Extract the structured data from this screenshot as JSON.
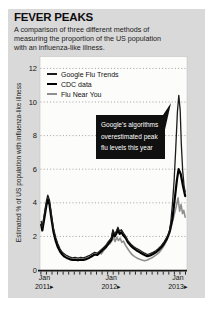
{
  "figure": {
    "title": "FEVER PEAKS",
    "subtitle_lines": [
      "A comparison of three different methods of",
      "measuring the proportion of the US population",
      "with an influenza-like illness."
    ]
  },
  "chart_data": {
    "type": "line",
    "title": "FEVER PEAKS",
    "ylabel": "Estimated % of US population with influenza-like illness",
    "ylim": [
      0,
      12
    ],
    "yticks": [
      0,
      2,
      4,
      6,
      8,
      10,
      12
    ],
    "x_encoding": "months since Jan 2011",
    "xlim": [
      -0.7,
      25.4
    ],
    "xticks": [
      {
        "m": 0,
        "month": "Jan",
        "year": "2011",
        "arrow": "▸"
      },
      {
        "m": 12,
        "month": "Jan",
        "year": "2012",
        "arrow": "▸"
      },
      {
        "m": 24,
        "month": "Jan",
        "year": "2013",
        "arrow": "▸"
      }
    ],
    "grid": "dotted-horizontal",
    "legend_position": "top-left-inside",
    "series": [
      {
        "name": "Google Flu Trends",
        "color": "#1c1c1c",
        "stroke_width": 1.3,
        "points": [
          [
            -0.6,
            2.9
          ],
          [
            -0.4,
            2.55
          ],
          [
            0,
            3.4
          ],
          [
            0.35,
            4.1
          ],
          [
            0.6,
            4.45
          ],
          [
            0.9,
            4.15
          ],
          [
            1.2,
            3.4
          ],
          [
            1.6,
            2.5
          ],
          [
            2,
            1.95
          ],
          [
            2.4,
            1.55
          ],
          [
            2.8,
            1.25
          ],
          [
            3.2,
            1.05
          ],
          [
            3.6,
            0.95
          ],
          [
            4,
            0.85
          ],
          [
            4.5,
            0.78
          ],
          [
            5,
            0.72
          ],
          [
            5.5,
            0.75
          ],
          [
            6,
            0.7
          ],
          [
            6.5,
            0.75
          ],
          [
            7,
            0.72
          ],
          [
            7.5,
            0.78
          ],
          [
            8,
            0.85
          ],
          [
            8.5,
            0.95
          ],
          [
            9,
            1.05
          ],
          [
            9.5,
            1.0
          ],
          [
            10,
            1.15
          ],
          [
            10.5,
            1.3
          ],
          [
            11,
            1.45
          ],
          [
            11.5,
            1.7
          ],
          [
            12,
            1.9
          ],
          [
            12.3,
            2.4
          ],
          [
            12.6,
            2.15
          ],
          [
            12.9,
            2.3
          ],
          [
            13.2,
            2.55
          ],
          [
            13.5,
            2.3
          ],
          [
            13.8,
            2.4
          ],
          [
            14.2,
            2.2
          ],
          [
            14.6,
            2.0
          ],
          [
            15,
            1.75
          ],
          [
            15.5,
            1.55
          ],
          [
            16,
            1.4
          ],
          [
            16.5,
            1.3
          ],
          [
            17,
            1.2
          ],
          [
            17.5,
            1.1
          ],
          [
            18,
            1.0
          ],
          [
            18.5,
            0.92
          ],
          [
            19,
            0.97
          ],
          [
            19.5,
            1.05
          ],
          [
            20,
            1.15
          ],
          [
            20.5,
            1.28
          ],
          [
            21,
            1.45
          ],
          [
            21.5,
            1.68
          ],
          [
            22,
            1.95
          ],
          [
            22.4,
            2.2
          ],
          [
            22.7,
            2.85
          ],
          [
            23,
            3.9
          ],
          [
            23.3,
            5.3
          ],
          [
            23.6,
            7.3
          ],
          [
            23.9,
            9.4
          ],
          [
            24.15,
            10.4
          ],
          [
            24.4,
            9.5
          ],
          [
            24.6,
            7.5
          ],
          [
            24.85,
            5.9
          ],
          [
            25.1,
            5.0
          ],
          [
            25.3,
            4.65
          ]
        ]
      },
      {
        "name": "CDC data",
        "color": "#000000",
        "stroke_width": 2.2,
        "points": [
          [
            -0.6,
            2.7
          ],
          [
            -0.4,
            2.35
          ],
          [
            0,
            3.15
          ],
          [
            0.35,
            3.85
          ],
          [
            0.6,
            4.2
          ],
          [
            0.9,
            3.9
          ],
          [
            1.2,
            3.15
          ],
          [
            1.6,
            2.3
          ],
          [
            2,
            1.75
          ],
          [
            2.4,
            1.35
          ],
          [
            2.8,
            1.1
          ],
          [
            3.2,
            0.92
          ],
          [
            3.6,
            0.8
          ],
          [
            4,
            0.72
          ],
          [
            4.5,
            0.65
          ],
          [
            5,
            0.6
          ],
          [
            5.5,
            0.62
          ],
          [
            6,
            0.58
          ],
          [
            6.5,
            0.62
          ],
          [
            7,
            0.6
          ],
          [
            7.5,
            0.65
          ],
          [
            8,
            0.72
          ],
          [
            8.5,
            0.82
          ],
          [
            9,
            0.92
          ],
          [
            9.5,
            0.9
          ],
          [
            10,
            1.05
          ],
          [
            10.5,
            1.2
          ],
          [
            11,
            1.35
          ],
          [
            11.5,
            1.58
          ],
          [
            12,
            1.78
          ],
          [
            12.3,
            2.2
          ],
          [
            12.6,
            2.0
          ],
          [
            12.9,
            2.15
          ],
          [
            13.2,
            2.4
          ],
          [
            13.5,
            2.15
          ],
          [
            13.8,
            2.25
          ],
          [
            14.2,
            2.05
          ],
          [
            14.6,
            1.9
          ],
          [
            15,
            1.65
          ],
          [
            15.5,
            1.45
          ],
          [
            16,
            1.3
          ],
          [
            16.5,
            1.18
          ],
          [
            17,
            1.08
          ],
          [
            17.5,
            0.98
          ],
          [
            18,
            0.9
          ],
          [
            18.5,
            0.82
          ],
          [
            19,
            0.87
          ],
          [
            19.5,
            0.95
          ],
          [
            20,
            1.05
          ],
          [
            20.5,
            1.18
          ],
          [
            21,
            1.35
          ],
          [
            21.5,
            1.58
          ],
          [
            22,
            1.85
          ],
          [
            22.5,
            2.3
          ],
          [
            23,
            3.05
          ],
          [
            23.4,
            4.2
          ],
          [
            23.8,
            5.35
          ],
          [
            24.1,
            6.0
          ],
          [
            24.5,
            5.7
          ],
          [
            24.9,
            5.0
          ],
          [
            25.3,
            4.4
          ]
        ]
      },
      {
        "name": "Flu Near You",
        "color": "#8f8f8f",
        "stroke_width": 1.6,
        "points": [
          [
            10.2,
            0.95
          ],
          [
            10.6,
            1.15
          ],
          [
            11,
            1.3
          ],
          [
            11.4,
            1.5
          ],
          [
            11.8,
            1.58
          ],
          [
            12.1,
            1.75
          ],
          [
            12.4,
            1.92
          ],
          [
            12.7,
            1.7
          ],
          [
            13,
            1.95
          ],
          [
            13.3,
            1.75
          ],
          [
            13.6,
            1.9
          ],
          [
            13.9,
            1.65
          ],
          [
            14.2,
            1.72
          ],
          [
            14.6,
            1.45
          ],
          [
            15,
            1.25
          ],
          [
            15.4,
            1.05
          ],
          [
            15.8,
            0.9
          ],
          [
            16.2,
            0.8
          ],
          [
            16.6,
            0.72
          ],
          [
            17,
            0.66
          ],
          [
            17.5,
            0.6
          ],
          [
            18,
            0.55
          ],
          [
            18.5,
            0.6
          ],
          [
            19,
            0.68
          ],
          [
            19.5,
            0.76
          ],
          [
            20,
            0.88
          ],
          [
            20.5,
            1.0
          ],
          [
            21,
            1.2
          ],
          [
            21.5,
            1.45
          ],
          [
            22,
            1.8
          ],
          [
            22.5,
            2.2
          ],
          [
            23,
            2.85
          ],
          [
            23.4,
            3.4
          ],
          [
            23.7,
            3.8
          ],
          [
            24,
            4.3
          ],
          [
            24.3,
            3.5
          ],
          [
            24.55,
            3.9
          ],
          [
            24.8,
            3.35
          ],
          [
            25.05,
            3.55
          ],
          [
            25.3,
            3.15
          ]
        ]
      }
    ],
    "annotation": {
      "lines": [
        "Google's algorithms",
        "overestimated peak",
        "flu levels this year"
      ],
      "bg": "#101010",
      "text_color": "#ffffff",
      "points_to": {
        "m": 24.15,
        "value": 10.4
      }
    },
    "colors": {
      "card_bg": "#d9d9d9",
      "plot_bg": "#fcfcfb",
      "grid": "#8a8a8a",
      "axis": "#151515",
      "plot_border": "#c4c4c4"
    }
  }
}
